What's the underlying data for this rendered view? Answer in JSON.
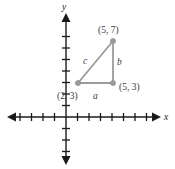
{
  "figure": {
    "type": "coordinate-plane-right-triangle",
    "background_color": "#ffffff",
    "axis_color": "#1a1a1a",
    "triangle_color": "#9b9b9b",
    "label_color": "#3a3a3a"
  },
  "axes": {
    "x_label": "x",
    "y_label": "y",
    "origin_px": {
      "x": 66,
      "y": 117
    },
    "tick_spacing_px": 11.5,
    "x_ticks_left": 4,
    "x_ticks_right": 8,
    "y_ticks_up": 7,
    "y_ticks_down": 3,
    "tick_half_length_px": 4,
    "x_axis_start_px": 10,
    "x_axis_end_px": 158,
    "y_axis_start_px": 16,
    "y_axis_end_px": 162
  },
  "triangle": {
    "vertices": [
      {
        "name": "vertex-a",
        "label": "(2, 3)",
        "x": 2,
        "y": 3,
        "px": {
          "x": 78,
          "y": 83
        },
        "label_px": {
          "x": 58,
          "y": 97
        }
      },
      {
        "name": "vertex-b",
        "label": "(5, 3)",
        "x": 5,
        "y": 3,
        "px": {
          "x": 113,
          "y": 83
        },
        "label_px": {
          "x": 119,
          "y": 90
        }
      },
      {
        "name": "vertex-c",
        "label": "(5, 7)",
        "x": 5,
        "y": 7,
        "px": {
          "x": 113,
          "y": 41
        },
        "label_px": {
          "x": 98,
          "y": 33
        }
      }
    ],
    "sides": [
      {
        "name": "side-a",
        "label": "a",
        "from": "(2, 3)",
        "to": "(5, 3)",
        "label_px": {
          "x": 94,
          "y": 98
        }
      },
      {
        "name": "side-b",
        "label": "b",
        "from": "(5, 3)",
        "to": "(5, 7)",
        "label_px": {
          "x": 118,
          "y": 64
        }
      },
      {
        "name": "side-c",
        "label": "c",
        "from": "(2, 3)",
        "to": "(5, 7)",
        "label_px": {
          "x": 84,
          "y": 63
        }
      }
    ]
  }
}
